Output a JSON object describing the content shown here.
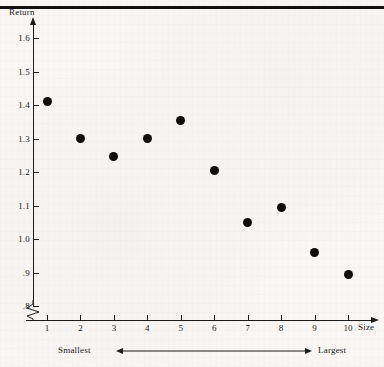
{
  "figure": {
    "background_color": "#f8f7f5",
    "ink_color": "#0d0d0d",
    "y_axis_title": "Return",
    "x_axis_title": "Size",
    "range_note": {
      "left_label": "Smallest",
      "right_label": "Largest",
      "arrow": "double-headed-arrow"
    }
  },
  "chart_data": {
    "type": "scatter",
    "title": "",
    "xlabel": "Size",
    "ylabel": "Return",
    "categories": [
      "1",
      "2",
      "3",
      "4",
      "5",
      "6",
      "7",
      "8",
      "9",
      "10"
    ],
    "x": [
      1,
      2,
      3,
      4,
      5,
      6,
      7,
      8,
      9,
      10
    ],
    "values": [
      1.41,
      1.3,
      1.245,
      1.3,
      1.355,
      1.205,
      1.05,
      1.095,
      0.96,
      0.895
    ],
    "series": [
      {
        "name": "Return",
        "values": [
          1.41,
          1.3,
          1.245,
          1.3,
          1.355,
          1.205,
          1.05,
          1.095,
          0.96,
          0.895
        ]
      }
    ],
    "xlim": [
      0.5,
      10.7
    ],
    "ylim": [
      0.77,
      1.65
    ],
    "ytick_labels": [
      "1.6",
      "1.5",
      "1.4",
      "1.3",
      "1.2",
      "1.1",
      "1.0",
      ".9",
      ".8"
    ],
    "ytick_values": [
      1.6,
      1.5,
      1.4,
      1.3,
      1.2,
      1.1,
      1.0,
      0.9,
      0.8
    ],
    "xtick_labels": [
      "1",
      "2",
      "3",
      "4",
      "5",
      "6",
      "7",
      "8",
      "9",
      "10"
    ],
    "grid": false,
    "legend": "none",
    "y_axis_broken": true,
    "annotations": [
      "Smallest",
      "Largest"
    ]
  }
}
